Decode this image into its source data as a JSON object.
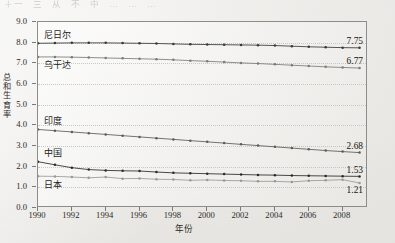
{
  "scan": {
    "bleed_text": "＋一　三　从　不　中　…　…　…"
  },
  "chart_data": {
    "type": "line",
    "title": "",
    "xlabel": "年份",
    "ylabel": "总和生育率",
    "xlim": [
      1990,
      2009.5
    ],
    "ylim": [
      0.0,
      9.0
    ],
    "grid": true,
    "grid_orientation": "horizontal",
    "legend_position": "inline-series-labels",
    "ytick_labels": [
      "0.0",
      "1.0",
      "2.0",
      "3.0",
      "4.0",
      "5.0",
      "6.0",
      "7.0",
      "8.0",
      "9.0"
    ],
    "ytick_values": [
      0.0,
      1.0,
      2.0,
      3.0,
      4.0,
      5.0,
      6.0,
      7.0,
      8.0,
      9.0
    ],
    "xtick_labels": [
      "1990",
      "1992",
      "1994",
      "1996",
      "1998",
      "2000",
      "2002",
      "2004",
      "2006",
      "2008"
    ],
    "xtick_values": [
      1990,
      1992,
      1994,
      1996,
      1998,
      2000,
      2002,
      2004,
      2006,
      2008
    ],
    "x": [
      1990,
      1991,
      1992,
      1993,
      1994,
      1995,
      1996,
      1997,
      1998,
      1999,
      2000,
      2001,
      2002,
      2003,
      2004,
      2005,
      2006,
      2007,
      2008,
      2009
    ],
    "series": [
      {
        "name": "尼日尔",
        "label": "尼日尔",
        "end_label": "7.75",
        "color": "#3a3835",
        "values": [
          7.97,
          7.98,
          7.99,
          7.99,
          7.99,
          7.98,
          7.97,
          7.96,
          7.94,
          7.92,
          7.91,
          7.9,
          7.89,
          7.88,
          7.86,
          7.83,
          7.8,
          7.78,
          7.76,
          7.75
        ]
      },
      {
        "name": "乌干达",
        "label": "乌干达",
        "end_label": "6.77",
        "color": "#7d7a76",
        "values": [
          7.31,
          7.31,
          7.3,
          7.28,
          7.26,
          7.24,
          7.22,
          7.2,
          7.17,
          7.13,
          7.1,
          7.06,
          7.02,
          6.99,
          6.95,
          6.91,
          6.87,
          6.83,
          6.8,
          6.77
        ]
      },
      {
        "name": "印度",
        "label": "印度",
        "end_label": "2.68",
        "color": "#5d5a56",
        "values": [
          3.8,
          3.74,
          3.68,
          3.62,
          3.56,
          3.5,
          3.44,
          3.38,
          3.32,
          3.26,
          3.2,
          3.14,
          3.08,
          3.02,
          2.96,
          2.9,
          2.84,
          2.78,
          2.73,
          2.68
        ]
      },
      {
        "name": "中国",
        "label": "中国",
        "end_label": "1.53",
        "color": "#2b2926",
        "values": [
          2.24,
          2.09,
          1.95,
          1.86,
          1.82,
          1.8,
          1.79,
          1.74,
          1.7,
          1.68,
          1.66,
          1.64,
          1.62,
          1.6,
          1.59,
          1.57,
          1.56,
          1.55,
          1.54,
          1.53
        ]
      },
      {
        "name": "日本",
        "label": "日本",
        "end_label": "1.21",
        "color": "#9a9894",
        "values": [
          1.54,
          1.53,
          1.5,
          1.46,
          1.5,
          1.42,
          1.43,
          1.39,
          1.38,
          1.34,
          1.36,
          1.33,
          1.32,
          1.29,
          1.29,
          1.26,
          1.32,
          1.34,
          1.37,
          1.21
        ]
      }
    ]
  },
  "series_labels": {
    "niger": "尼日尔",
    "uganda": "乌干达",
    "india": "印度",
    "china": "中国",
    "japan": "日本"
  },
  "end_values": {
    "niger": "7.75",
    "uganda": "6.77",
    "india": "2.68",
    "china": "1.53",
    "japan": "1.21"
  }
}
